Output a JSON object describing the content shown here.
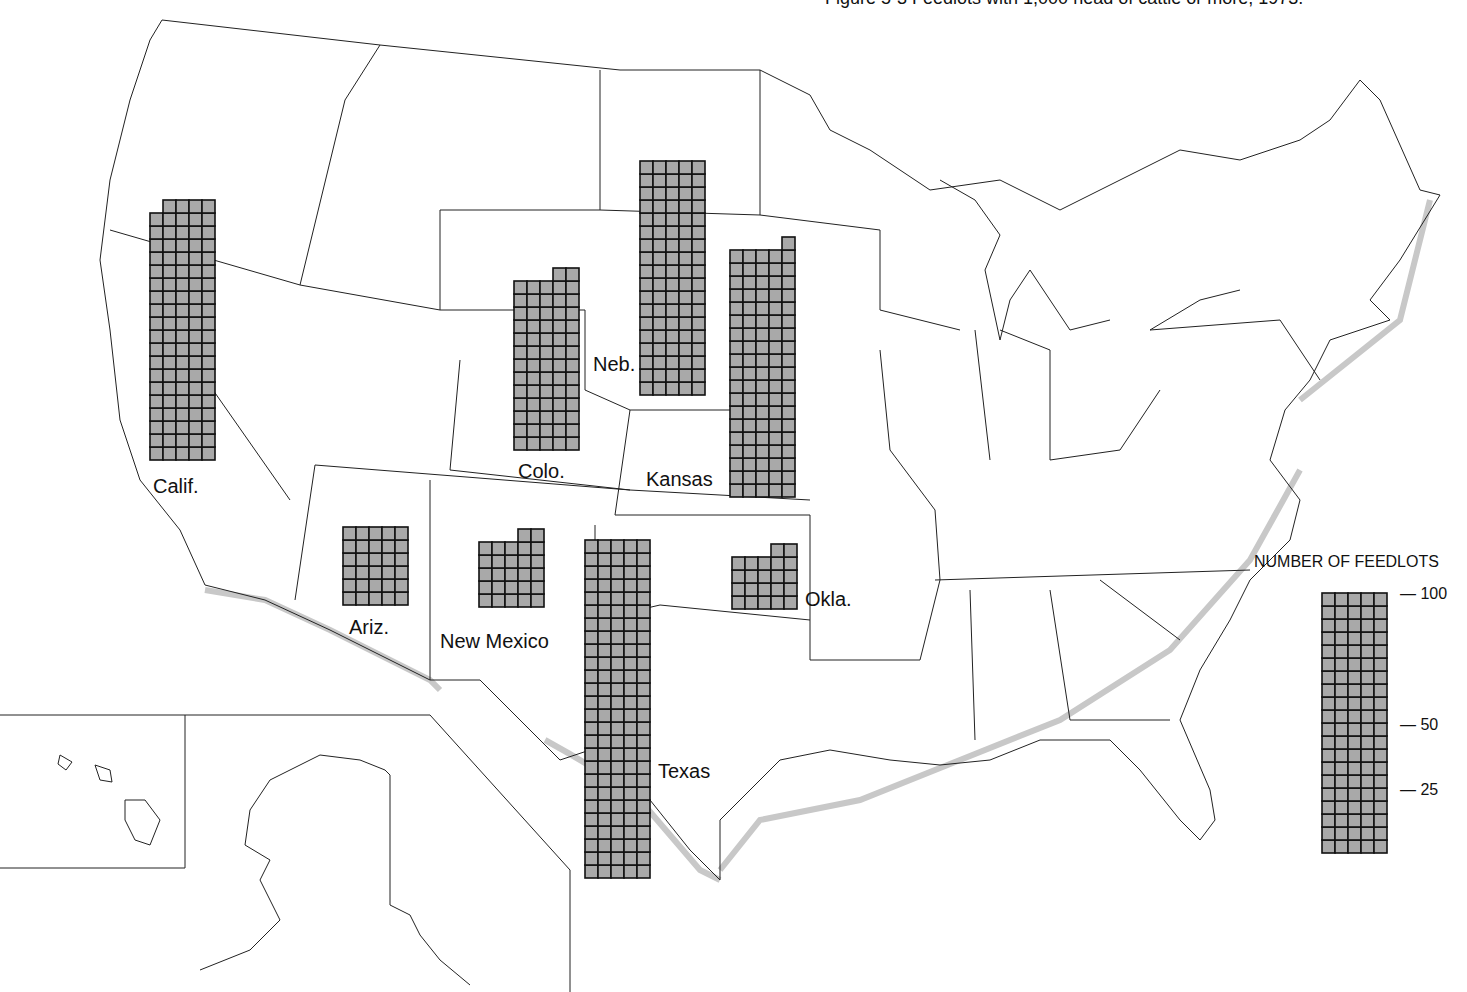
{
  "title": "Figure 5-3 Feedlots with 1,000 head of cattle or more, 1973.",
  "legend": {
    "title": "NUMBER OF FEEDLOTS",
    "ticks": [
      {
        "value": 100,
        "label": "— 100"
      },
      {
        "value": 50,
        "label": "— 50"
      },
      {
        "value": 25,
        "label": "— 25"
      }
    ],
    "cells_per_row": 5,
    "units_per_cell": 1
  },
  "colors": {
    "cell_fill": "#a9a9a9",
    "cell_line": "#111111",
    "boundary": "#222222",
    "coast_shadow": "#c8c8c8"
  },
  "states": [
    {
      "name": "Calif.",
      "count": 99
    },
    {
      "name": "Colo.",
      "count": 67
    },
    {
      "name": "Neb.",
      "count": 90
    },
    {
      "name": "Kansas",
      "count": 96
    },
    {
      "name": "Ariz.",
      "count": 30
    },
    {
      "name": "New Mexico",
      "count": 27
    },
    {
      "name": "Texas",
      "count": 130
    },
    {
      "name": "Okla.",
      "count": 22
    }
  ],
  "chart_data": {
    "type": "map-pictogram",
    "title": "Feedlots with 1,000 head of cattle or more",
    "unit": "number of feedlots (1 cell = 1 feedlot, 5 per row)",
    "categories": [
      "Calif.",
      "Colo.",
      "Neb.",
      "Kansas",
      "Ariz.",
      "New Mexico",
      "Texas",
      "Okla."
    ],
    "values": [
      99,
      67,
      90,
      96,
      30,
      27,
      130,
      22
    ],
    "legend_scale": [
      25,
      50,
      100
    ]
  }
}
